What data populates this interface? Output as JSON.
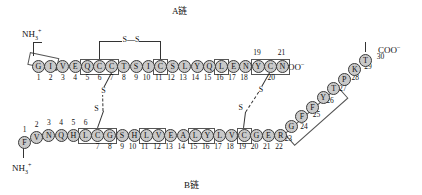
{
  "figure": {
    "title_a": "A链",
    "title_b": "B链",
    "n_terminus": "NH",
    "n_terminus_sub": "3",
    "n_terminus_sup": "+",
    "c_terminus": "COO",
    "c_terminus_sup": "−",
    "disulfide_label": "S",
    "disulfide_bridge_label": "S—S",
    "bead_color": "#c9c9c9",
    "stroke_color": "#333333"
  },
  "chain_a": {
    "name": "A链",
    "length": 21,
    "residues": [
      {
        "n": 1,
        "aa": "G"
      },
      {
        "n": 2,
        "aa": "I"
      },
      {
        "n": 3,
        "aa": "V"
      },
      {
        "n": 4,
        "aa": "E"
      },
      {
        "n": 5,
        "aa": "Q"
      },
      {
        "n": 6,
        "aa": "C"
      },
      {
        "n": 7,
        "aa": "C"
      },
      {
        "n": 8,
        "aa": "T"
      },
      {
        "n": 9,
        "aa": "S"
      },
      {
        "n": 10,
        "aa": "I"
      },
      {
        "n": 11,
        "aa": "C"
      },
      {
        "n": 12,
        "aa": "S"
      },
      {
        "n": 13,
        "aa": "L"
      },
      {
        "n": 14,
        "aa": "Y"
      },
      {
        "n": 15,
        "aa": "Q"
      },
      {
        "n": 16,
        "aa": "L"
      },
      {
        "n": 17,
        "aa": "E"
      },
      {
        "n": 18,
        "aa": "N"
      },
      {
        "n": 19,
        "aa": "Y"
      },
      {
        "n": 20,
        "aa": "C"
      },
      {
        "n": 21,
        "aa": "N"
      }
    ],
    "sequence": "GIVEQCCTSICSLYQLENYCN",
    "numbers_above": [
      "19",
      "21"
    ],
    "number_below_inline": "20"
  },
  "chain_b": {
    "name": "B链",
    "length": 30,
    "residues": [
      {
        "n": 1,
        "aa": "F"
      },
      {
        "n": 2,
        "aa": "V"
      },
      {
        "n": 3,
        "aa": "N"
      },
      {
        "n": 4,
        "aa": "Q"
      },
      {
        "n": 5,
        "aa": "H"
      },
      {
        "n": 6,
        "aa": "L"
      },
      {
        "n": 7,
        "aa": "C"
      },
      {
        "n": 8,
        "aa": "G"
      },
      {
        "n": 9,
        "aa": "S"
      },
      {
        "n": 10,
        "aa": "H"
      },
      {
        "n": 11,
        "aa": "L"
      },
      {
        "n": 12,
        "aa": "V"
      },
      {
        "n": 13,
        "aa": "E"
      },
      {
        "n": 14,
        "aa": "A"
      },
      {
        "n": 15,
        "aa": "L"
      },
      {
        "n": 16,
        "aa": "Y"
      },
      {
        "n": 17,
        "aa": "L"
      },
      {
        "n": 18,
        "aa": "V"
      },
      {
        "n": 19,
        "aa": "C"
      },
      {
        "n": 20,
        "aa": "G"
      },
      {
        "n": 21,
        "aa": "E"
      },
      {
        "n": 22,
        "aa": "R"
      },
      {
        "n": 23,
        "aa": "G"
      },
      {
        "n": 24,
        "aa": "F"
      },
      {
        "n": 25,
        "aa": "F"
      },
      {
        "n": 26,
        "aa": "Y"
      },
      {
        "n": 27,
        "aa": "T"
      },
      {
        "n": 28,
        "aa": "P"
      },
      {
        "n": 29,
        "aa": "K"
      },
      {
        "n": 30,
        "aa": "T"
      }
    ],
    "sequence": "FVNQHLCGSHLVEALYLVCGERGFFYTPKT",
    "numbers_above": [
      "1",
      "2",
      "3",
      "4",
      "5",
      "6"
    ],
    "numbers_tail": [
      "23",
      "24",
      "25",
      "26",
      "27",
      "28",
      "29",
      "30"
    ]
  },
  "disulfide_bonds": [
    {
      "label": "S—S",
      "from": "A6",
      "to": "A11",
      "kind": "intrachain"
    },
    {
      "label": "S",
      "from": "A7",
      "to": "B7",
      "kind": "interchain"
    },
    {
      "label": "S",
      "from": "A20",
      "to": "B19",
      "kind": "interchain"
    }
  ]
}
